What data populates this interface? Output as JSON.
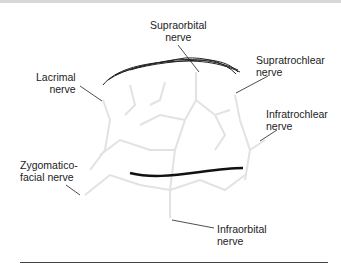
{
  "diagram": {
    "labels": {
      "supraorbital": [
        "Supraorbital",
        "nerve"
      ],
      "supratrochlear": [
        "Supratrochlear",
        "nerve"
      ],
      "lacrimal": [
        "Lacrimal",
        "nerve"
      ],
      "infratrochlear": [
        "Infratrochlear",
        "nerve"
      ],
      "zygomaticofacial": [
        "Zygomatico-",
        "facial nerve"
      ],
      "infraorbital": [
        "Infraorbital",
        "nerve"
      ]
    },
    "colors": {
      "line": "#222222",
      "nerve_branches": "#e4e4e4",
      "rule": "#444444"
    }
  }
}
